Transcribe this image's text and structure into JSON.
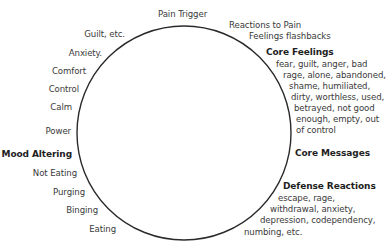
{
  "diagram": {
    "type": "cycle",
    "top": "Pain Trigger",
    "right": {
      "reactions": [
        "Reactions to Pain",
        "Feelings flashbacks"
      ],
      "core_feelings": {
        "heading": "Core Feelings",
        "lines": [
          "fear, guilt, anger, bad",
          "rage, alone, abandoned,",
          "shame, humiliated,",
          "dirty, worthless, used,",
          "betrayed, not good",
          "enough, empty, out",
          "of control"
        ]
      },
      "core_messages": {
        "heading": "Core Messages"
      },
      "defense_reactions": {
        "heading": "Defense Reactions",
        "lines": [
          "escape, rage,",
          "withdrawal, anxiety,",
          "depression, codependency,",
          "numbing, etc."
        ]
      }
    },
    "left": {
      "upper": [
        "Guilt, etc.",
        "Anxiety.",
        "Comfort",
        "Control",
        "Calm",
        "Power"
      ],
      "heading": "Mood Altering",
      "lower": [
        "Not Eating",
        "Purging",
        "Binging",
        "Eating"
      ]
    },
    "colors": {
      "circle": "#2a2a2a",
      "text": "#3a3a3a",
      "heading": "#1e1e1e"
    }
  }
}
